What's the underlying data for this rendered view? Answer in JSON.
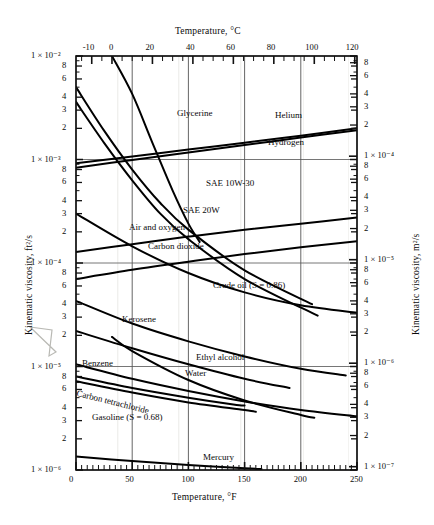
{
  "figure": {
    "top_axis_title": "Temperature,  °C",
    "bottom_axis_title": "Temperature,  °F",
    "left_axis_title": "Kinematic viscosity, ft²/s",
    "right_axis_title": "Kinematic viscosity, m²/s"
  },
  "chart_data": {
    "type": "line",
    "xlabel": "Temperature, °F",
    "ylabel": "Kinematic viscosity, ft²/s",
    "x2label": "Temperature, °C",
    "y2label": "Kinematic viscosity, m²/s",
    "xlim": [
      0,
      250
    ],
    "x2lim": [
      -17.8,
      121.1
    ],
    "ylim": [
      1e-06,
      0.01
    ],
    "y2lim": [
      9.29e-08,
      0.000929
    ],
    "yscale": "log",
    "grid": true,
    "legend": "inline-labels",
    "xticks": [
      0,
      50,
      100,
      150,
      200,
      250
    ],
    "xticklabels": [
      "0",
      "50",
      "100",
      "150",
      "200",
      "250"
    ],
    "x2ticks": [
      -10,
      0,
      20,
      40,
      60,
      80,
      100,
      120
    ],
    "x2ticklabels": [
      "-10",
      "0",
      "20",
      "40",
      "60",
      "80",
      "100",
      "120"
    ],
    "ydecades": [
      "1 × 10⁻²",
      "1 × 10⁻³",
      "1 × 10⁻⁴",
      "1 × 10⁻⁵",
      "1 × 10⁻⁶"
    ],
    "yminorlabels": [
      "8",
      "6",
      "4",
      "3",
      "2"
    ],
    "y2decades": [
      "1 × 10⁻⁴",
      "1 × 10⁻⁵",
      "1 × 10⁻⁶",
      "1 × 10⁻⁷"
    ],
    "y2minorlabels": [
      "8",
      "6",
      "4",
      "3",
      "2"
    ],
    "series": [
      {
        "name": "Glycerine",
        "label": "Glycerine",
        "points": [
          [
            32,
            0.01
          ],
          [
            50,
            0.0043
          ],
          [
            68,
            0.00145
          ],
          [
            86,
            0.0005
          ],
          [
            100,
            0.00024
          ],
          [
            110,
            0.00016
          ]
        ]
      },
      {
        "name": "Helium",
        "label": "Helium",
        "points": [
          [
            0,
            0.00092
          ],
          [
            50,
            0.00107
          ],
          [
            100,
            0.00125
          ],
          [
            150,
            0.00145
          ],
          [
            200,
            0.0017
          ],
          [
            250,
            0.002
          ]
        ]
      },
      {
        "name": "Hydrogen",
        "label": "Hydrogen",
        "points": [
          [
            0,
            0.00083
          ],
          [
            50,
            0.00099
          ],
          [
            100,
            0.00117
          ],
          [
            150,
            0.00138
          ],
          [
            200,
            0.00163
          ],
          [
            250,
            0.00192
          ]
        ]
      },
      {
        "name": "SAE 10W-30",
        "label": "SAE  10W-30",
        "points": [
          [
            0,
            0.005
          ],
          [
            25,
            0.0019
          ],
          [
            50,
            0.0008
          ],
          [
            75,
            0.00038
          ],
          [
            100,
            0.00021
          ],
          [
            150,
            8.5e-05
          ],
          [
            210,
            4e-05
          ]
        ]
      },
      {
        "name": "SAE 20W",
        "label": "SAE 20W",
        "points": [
          [
            0,
            0.0036
          ],
          [
            25,
            0.00145
          ],
          [
            50,
            0.00063
          ],
          [
            75,
            0.0003
          ],
          [
            100,
            0.00017
          ],
          [
            150,
            7e-05
          ],
          [
            215,
            3.1e-05
          ]
        ]
      },
      {
        "name": "Air and oxygen",
        "label": "Air  and  oxygen",
        "points": [
          [
            0,
            0.000128
          ],
          [
            50,
            0.000152
          ],
          [
            100,
            0.00018
          ],
          [
            150,
            0.00021
          ],
          [
            200,
            0.00024
          ],
          [
            250,
            0.000275
          ]
        ]
      },
      {
        "name": "Carbon dioxide",
        "label": "Carbon dioxide",
        "points": [
          [
            0,
            7e-05
          ],
          [
            50,
            8.6e-05
          ],
          [
            100,
            0.000103
          ],
          [
            150,
            0.000122
          ],
          [
            200,
            0.000142
          ],
          [
            250,
            0.000162
          ]
        ]
      },
      {
        "name": "Crude oil (S = 0.86)",
        "label": "Crude oil (S  =  0.86)",
        "points": [
          [
            0,
            0.0003
          ],
          [
            50,
            0.000145
          ],
          [
            100,
            8e-05
          ],
          [
            150,
            5.2e-05
          ],
          [
            200,
            3.9e-05
          ],
          [
            250,
            3.3e-05
          ]
        ]
      },
      {
        "name": "Kerosene",
        "label": "Kerosene",
        "points": [
          [
            0,
            4.3e-05
          ],
          [
            50,
            2.6e-05
          ],
          [
            100,
            1.75e-05
          ],
          [
            150,
            1.25e-05
          ],
          [
            200,
            9.5e-06
          ],
          [
            240,
            8.2e-06
          ]
        ]
      },
      {
        "name": "Ethyl alcohol",
        "label": "Ethyl alcohol",
        "points": [
          [
            0,
            2.2e-05
          ],
          [
            50,
            1.5e-05
          ],
          [
            100,
            1.05e-05
          ],
          [
            150,
            7.6e-06
          ],
          [
            190,
            6.2e-06
          ]
        ]
      },
      {
        "name": "Water",
        "label": "Water",
        "points": [
          [
            32,
            1.93e-05
          ],
          [
            50,
            1.41e-05
          ],
          [
            100,
            7.4e-06
          ],
          [
            150,
            4.7e-06
          ],
          [
            200,
            3.4e-06
          ],
          [
            212,
            3.2e-06
          ]
        ]
      },
      {
        "name": "Benzene",
        "label": "Benzene",
        "points": [
          [
            0,
            1.05e-05
          ],
          [
            50,
            7.6e-06
          ],
          [
            100,
            5.8e-06
          ],
          [
            150,
            4.6e-06
          ],
          [
            200,
            3.8e-06
          ],
          [
            250,
            3.3e-06
          ]
        ]
      },
      {
        "name": "Carbon tetrachloride",
        "label": "Carbon tetrachloride",
        "points": [
          [
            0,
            7.2e-06
          ],
          [
            50,
            5.6e-06
          ],
          [
            100,
            4.5e-06
          ],
          [
            150,
            3.8e-06
          ],
          [
            160,
            3.65e-06
          ]
        ]
      },
      {
        "name": "Gasoline (S = 0.68)",
        "label": "Gasoline (S  =  0.68)",
        "points": [
          [
            0,
            8e-06
          ],
          [
            50,
            6.2e-06
          ],
          [
            100,
            5e-06
          ],
          [
            140,
            4.3e-06
          ],
          [
            150,
            4.2e-06
          ]
        ]
      },
      {
        "name": "Mercury",
        "label": "Mercury",
        "points": [
          [
            0,
            1.35e-06
          ],
          [
            50,
            1.22e-06
          ],
          [
            100,
            1.12e-06
          ],
          [
            150,
            1.04e-06
          ],
          [
            165,
            1.02e-06
          ]
        ]
      }
    ],
    "curve_labels": [
      {
        "text": "Glycerine",
        "x": 177,
        "y": 108
      },
      {
        "text": "Helium",
        "x": 275,
        "y": 110
      },
      {
        "text": "Hydrogen",
        "x": 268,
        "y": 137
      },
      {
        "text": "SAE  10W-30",
        "x": 206,
        "y": 178
      },
      {
        "text": "SAE 20W",
        "x": 183,
        "y": 205
      },
      {
        "text": "Air  and  oxygen",
        "x": 129,
        "y": 222
      },
      {
        "text": "Carbon dioxide",
        "x": 148,
        "y": 241
      },
      {
        "text": "Crude oil (S  =  0.86)",
        "x": 213,
        "y": 280
      },
      {
        "text": "Kerosene",
        "x": 122,
        "y": 314
      },
      {
        "text": "Ethyl alcohol",
        "x": 196,
        "y": 352
      },
      {
        "text": "Benzene",
        "x": 82,
        "y": 358
      },
      {
        "text": "Water",
        "x": 185,
        "y": 368
      },
      {
        "text": "Carbon tetrachloride",
        "x": 78,
        "y": 388
      },
      {
        "text": "Gasoline (S  =  0.68)",
        "x": 92,
        "y": 412
      },
      {
        "text": "Mercury",
        "x": 203,
        "y": 452
      }
    ]
  }
}
